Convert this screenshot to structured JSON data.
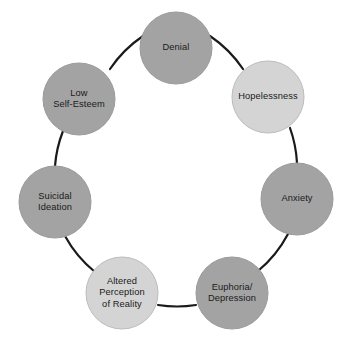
{
  "diagram": {
    "type": "cycle",
    "shape": "circular-loop",
    "node_count": 8,
    "direction": "clockwise",
    "background_color": "#ffffff",
    "connector_color": "#1a1a1a",
    "connector_width": 2,
    "label_color": "#1a1a1a",
    "fill_dark": "#a3a3a3",
    "fill_light": "#d4d4d4",
    "stroke_color": "#9a9a9a",
    "center": {
      "x": 176,
      "y": 175
    },
    "ring_radius": 122,
    "node_radius": 36,
    "nodes": [
      {
        "id": "denial",
        "label": "Denial",
        "angle_deg": -90,
        "cx": 176,
        "cy": 48,
        "r": 36,
        "fill": "#a3a3a3",
        "tone": "dark"
      },
      {
        "id": "hopelessness",
        "label": "Hopelessness",
        "angle_deg": -45,
        "cx": 268,
        "cy": 97,
        "r": 36,
        "fill": "#d4d4d4",
        "tone": "light"
      },
      {
        "id": "anxiety",
        "label": "Anxiety",
        "angle_deg": 0,
        "cx": 297,
        "cy": 199,
        "r": 36,
        "fill": "#a3a3a3",
        "tone": "dark"
      },
      {
        "id": "euphoria-depression",
        "label": "Euphoria/\nDepression",
        "angle_deg": 45,
        "cx": 232,
        "cy": 293,
        "r": 36,
        "fill": "#a3a3a3",
        "tone": "dark"
      },
      {
        "id": "altered-perception-of-reality",
        "label": "Altered\nPerception\nof Reality",
        "angle_deg": 90,
        "cx": 122,
        "cy": 293,
        "r": 36,
        "fill": "#d4d4d4",
        "tone": "light"
      },
      {
        "id": "suicidal-ideation",
        "label": "Suicidal\nIdeation",
        "angle_deg": 135,
        "cx": 55,
        "cy": 202,
        "r": 36,
        "fill": "#a3a3a3",
        "tone": "dark"
      },
      {
        "id": "low-self-esteem",
        "label": "Low\nSelf-Esteem",
        "angle_deg": 180,
        "cx": 79,
        "cy": 99,
        "r": 36,
        "fill": "#a3a3a3",
        "tone": "dark"
      }
    ]
  }
}
